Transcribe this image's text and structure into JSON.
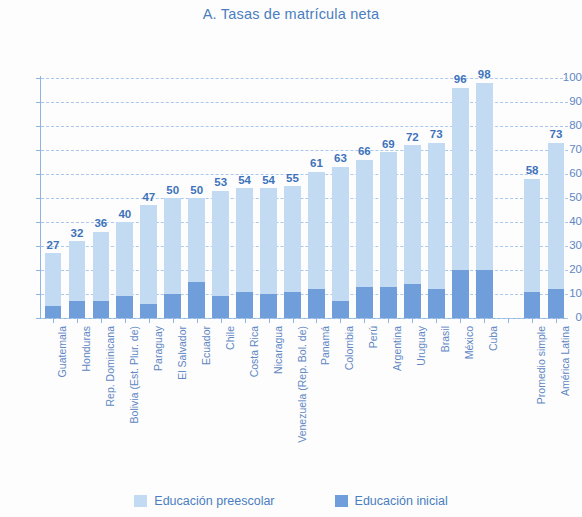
{
  "chart_data": {
    "type": "bar",
    "title": "A. Tasas de matrícula neta",
    "xlabel": "",
    "ylabel": "",
    "ylim": [
      0,
      100
    ],
    "yticks": [
      0,
      10,
      20,
      30,
      40,
      50,
      60,
      70,
      80,
      90,
      100
    ],
    "grid": true,
    "stacked": true,
    "legend_position": "bottom",
    "categories": [
      "Guatemala",
      "Honduras",
      "Rep. Dominicana",
      "Bolivia (Est. Plur. de)",
      "Paraguay",
      "El Salvador",
      "Ecuador",
      "Chile",
      "Costa Rica",
      "Nicaragua",
      "Venezuela (Rep. Bol. de)",
      "Panamá",
      "Colombia",
      "Perú",
      "Argentina",
      "Uruguay",
      "Brasil",
      "México",
      "Cuba",
      "",
      "Promedio simple",
      "América Latina"
    ],
    "series": [
      {
        "name": "Educación preescolar",
        "color": "#c2daf2",
        "values": [
          27,
          32,
          36,
          40,
          47,
          50,
          50,
          53,
          54,
          54,
          55,
          61,
          63,
          66,
          69,
          72,
          73,
          96,
          98,
          null,
          58,
          73
        ]
      },
      {
        "name": "Educación inicial",
        "color": "#6f9edb",
        "values": [
          5,
          7,
          7,
          9,
          6,
          10,
          15,
          9,
          11,
          10,
          11,
          12,
          7,
          13,
          13,
          14,
          12,
          20,
          20,
          null,
          11,
          12
        ]
      }
    ],
    "bar_labels": [
      "27",
      "32",
      "36",
      "40",
      "47",
      "50",
      "50",
      "53",
      "54",
      "54",
      "55",
      "61",
      "63",
      "66",
      "69",
      "72",
      "73",
      "96",
      "98",
      "",
      "58",
      "73"
    ]
  },
  "legend": {
    "items": [
      {
        "label": "Educación preescolar",
        "color": "#c2daf2"
      },
      {
        "label": "Educación inicial",
        "color": "#6f9edb"
      }
    ]
  }
}
